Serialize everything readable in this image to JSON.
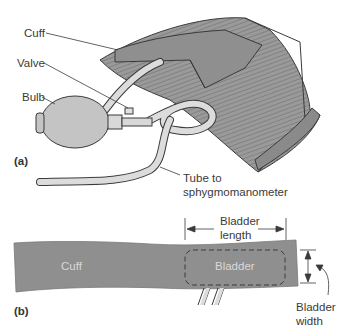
{
  "figure": {
    "panel_a": {
      "label": "(a)",
      "callouts": {
        "cuff": "Cuff",
        "valve": "Valve",
        "bulb": "Bulb",
        "tube_line1": "Tube to",
        "tube_line2": "sphygmomanometer"
      }
    },
    "panel_b": {
      "label": "(b)",
      "cuff_label": "Cuff",
      "bladder_label": "Bladder",
      "length_line1": "Bladder",
      "length_line2": "length",
      "width_line1": "Bladder",
      "width_line2": "width"
    },
    "colors": {
      "cuff_fill": "#8f8f8f",
      "cuff_stripe": "#a8a8a8",
      "bulb_fill": "#c4c4c4",
      "tube_fill": "#dcdcdc",
      "outline": "#3a3a3a"
    }
  }
}
